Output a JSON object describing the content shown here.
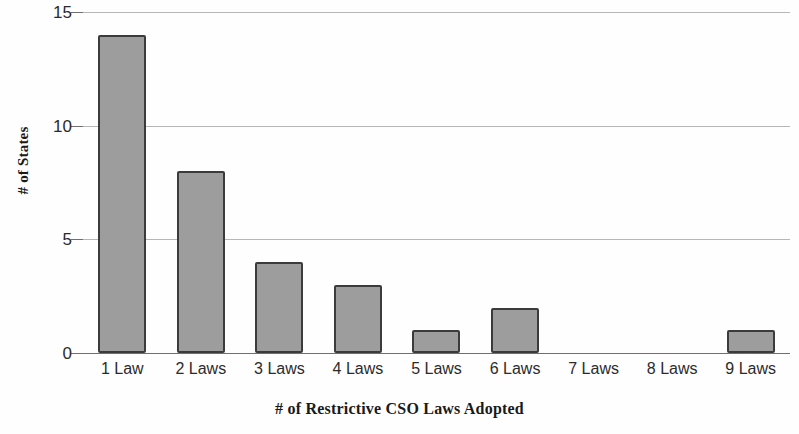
{
  "chart_data": {
    "type": "bar",
    "title": "",
    "xlabel": "# of Restrictive CSO Laws Adopted",
    "ylabel": "# of States",
    "categories": [
      "1 Law",
      "2 Laws",
      "3 Laws",
      "4 Laws",
      "5 Laws",
      "6 Laws",
      "7 Laws",
      "8 Laws",
      "9 Laws"
    ],
    "values": [
      14,
      8,
      4,
      3,
      1,
      2,
      0,
      0,
      1
    ],
    "ylim": [
      0,
      15
    ],
    "yticks": [
      0,
      5,
      10,
      15
    ],
    "ytick_labels": [
      "0",
      "5",
      "10",
      "15"
    ],
    "grid": true,
    "grid_axis": "y",
    "legend": null,
    "bar_color": "#9d9d9d",
    "bar_edge_color": "#3b3b3b",
    "grid_color": "#b7b7b7",
    "axis_color": "#6f6f6f",
    "background": "#ffffff"
  }
}
